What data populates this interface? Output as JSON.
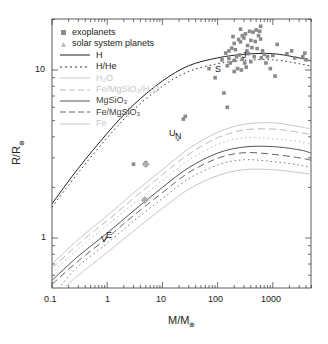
{
  "chart_data": {
    "type": "scatter",
    "title": "",
    "xlabel": "M/M⊕",
    "ylabel": "R/R⊕",
    "xscale": "log",
    "yscale": "log",
    "xlim": [
      0.1,
      5000
    ],
    "ylim": [
      0.5,
      20
    ],
    "x_ticks": [
      "0.1",
      "1",
      "10",
      "100",
      "1000"
    ],
    "y_ticks": [
      "1",
      "10"
    ],
    "grid": false,
    "legend_position": "upper left",
    "legend": [
      {
        "label": "exoplanets",
        "style": "square-marker",
        "color": "#8a8a8a"
      },
      {
        "label": "solar system planets",
        "style": "triangle-marker",
        "color": "#aaaaaa"
      },
      {
        "label": "H",
        "style": "solid",
        "color": "#222222"
      },
      {
        "label": "H/He",
        "style": "dotted",
        "color": "#333333"
      },
      {
        "label": "H₂O",
        "style": "solid",
        "color": "#c8c8c8"
      },
      {
        "label": "Fe/MgSiO₃/H₂O",
        "style": "dashed",
        "color": "#c8c8c8"
      },
      {
        "label": "MgSiO₃",
        "style": "solid",
        "color": "#555555"
      },
      {
        "label": "Fe/MgSiO₃",
        "style": "dashed",
        "color": "#666666"
      },
      {
        "label": "Fe",
        "style": "solid",
        "color": "#c8c8c8"
      }
    ],
    "series": [
      {
        "name": "H",
        "style": "solid",
        "color": "#222222",
        "width": 1,
        "points": [
          [
            0.1,
            1.6
          ],
          [
            0.3,
            2.6
          ],
          [
            1,
            4.2
          ],
          [
            3,
            6.2
          ],
          [
            10,
            8.6
          ],
          [
            30,
            10.6
          ],
          [
            100,
            11.8
          ],
          [
            300,
            12.4
          ],
          [
            1000,
            12.5
          ],
          [
            3000,
            11.8
          ],
          [
            5000,
            11.3
          ]
        ]
      },
      {
        "name": "H/He",
        "style": "dotted",
        "color": "#333333",
        "width": 1,
        "points": [
          [
            0.1,
            1.53
          ],
          [
            0.3,
            2.45
          ],
          [
            1,
            3.95
          ],
          [
            3,
            5.8
          ],
          [
            10,
            8.0
          ],
          [
            30,
            9.8
          ],
          [
            100,
            10.9
          ],
          [
            300,
            11.4
          ],
          [
            1000,
            11.5
          ],
          [
            3000,
            10.9
          ],
          [
            5000,
            10.5
          ]
        ]
      },
      {
        "name": "H₂O",
        "style": "solid",
        "color": "#c8c8c8",
        "width": 1,
        "points": [
          [
            0.1,
            0.7
          ],
          [
            0.3,
            0.98
          ],
          [
            1,
            1.36
          ],
          [
            3,
            1.85
          ],
          [
            10,
            2.55
          ],
          [
            30,
            3.4
          ],
          [
            100,
            4.25
          ],
          [
            300,
            4.75
          ],
          [
            1000,
            4.85
          ],
          [
            3000,
            4.6
          ],
          [
            5000,
            4.45
          ]
        ]
      },
      {
        "name": "Fe/MgSiO₃/H₂O",
        "style": "dashed",
        "color": "#bbbbbb",
        "width": 1,
        "points": [
          [
            0.1,
            0.66
          ],
          [
            0.3,
            0.92
          ],
          [
            1,
            1.27
          ],
          [
            3,
            1.72
          ],
          [
            10,
            2.38
          ],
          [
            30,
            3.15
          ],
          [
            100,
            3.95
          ],
          [
            300,
            4.4
          ],
          [
            1000,
            4.45
          ],
          [
            3000,
            4.25
          ],
          [
            5000,
            4.1
          ]
        ]
      },
      {
        "name": "H₂O-dotted",
        "style": "dotted",
        "color": "#bbbbbb",
        "width": 1,
        "points": [
          [
            0.1,
            0.62
          ],
          [
            0.3,
            0.86
          ],
          [
            1,
            1.19
          ],
          [
            3,
            1.6
          ],
          [
            10,
            2.2
          ],
          [
            30,
            2.9
          ],
          [
            100,
            3.6
          ],
          [
            300,
            3.95
          ],
          [
            1000,
            3.9
          ],
          [
            3000,
            3.75
          ],
          [
            5000,
            3.6
          ]
        ]
      },
      {
        "name": "MgSiO₃",
        "style": "solid",
        "color": "#555555",
        "width": 1,
        "points": [
          [
            0.1,
            0.56
          ],
          [
            0.3,
            0.78
          ],
          [
            1,
            1.07
          ],
          [
            3,
            1.45
          ],
          [
            10,
            2.0
          ],
          [
            30,
            2.62
          ],
          [
            100,
            3.2
          ],
          [
            300,
            3.48
          ],
          [
            1000,
            3.5
          ],
          [
            3000,
            3.35
          ],
          [
            5000,
            3.2
          ]
        ]
      },
      {
        "name": "Fe/MgSiO₃",
        "style": "dashed",
        "color": "#666666",
        "width": 1,
        "points": [
          [
            0.1,
            0.53
          ],
          [
            0.3,
            0.73
          ],
          [
            1,
            1.0
          ],
          [
            3,
            1.36
          ],
          [
            10,
            1.86
          ],
          [
            30,
            2.45
          ],
          [
            100,
            2.98
          ],
          [
            300,
            3.22
          ],
          [
            1000,
            3.15
          ],
          [
            3000,
            3.0
          ],
          [
            5000,
            2.9
          ]
        ]
      },
      {
        "name": "Fe/MgSiO₃-dotted",
        "style": "dotted",
        "color": "#777777",
        "width": 1,
        "points": [
          [
            0.13,
            0.5
          ],
          [
            0.3,
            0.68
          ],
          [
            1,
            0.93
          ],
          [
            3,
            1.26
          ],
          [
            10,
            1.72
          ],
          [
            30,
            2.25
          ],
          [
            100,
            2.72
          ],
          [
            300,
            2.92
          ],
          [
            1000,
            2.85
          ],
          [
            3000,
            2.72
          ],
          [
            5000,
            2.62
          ]
        ]
      },
      {
        "name": "Fe",
        "style": "solid",
        "color": "#c8c8c8",
        "width": 1,
        "points": [
          [
            0.16,
            0.5
          ],
          [
            0.3,
            0.6
          ],
          [
            1,
            0.82
          ],
          [
            3,
            1.1
          ],
          [
            10,
            1.5
          ],
          [
            30,
            1.95
          ],
          [
            100,
            2.35
          ],
          [
            300,
            2.55
          ],
          [
            1000,
            2.55
          ],
          [
            3000,
            2.45
          ],
          [
            5000,
            2.4
          ]
        ]
      }
    ],
    "exoplanets": [
      [
        3,
        2.75
      ],
      [
        5,
        2.8
      ],
      [
        24,
        5.1
      ],
      [
        26,
        5.3
      ],
      [
        130,
        7.3
      ],
      [
        150,
        6.0
      ],
      [
        90,
        9.0
      ],
      [
        70,
        10.2
      ],
      [
        150,
        10.6
      ],
      [
        170,
        11.0
      ],
      [
        200,
        11.4
      ],
      [
        220,
        12.0
      ],
      [
        180,
        13.5
      ],
      [
        200,
        14.4
      ],
      [
        210,
        13.2
      ],
      [
        240,
        15.2
      ],
      [
        260,
        14.7
      ],
      [
        280,
        16.0
      ],
      [
        300,
        15.5
      ],
      [
        320,
        16.4
      ],
      [
        340,
        13.0
      ],
      [
        350,
        14.0
      ],
      [
        360,
        12.5
      ],
      [
        380,
        17.0
      ],
      [
        400,
        15.0
      ],
      [
        400,
        11.2
      ],
      [
        420,
        13.6
      ],
      [
        440,
        16.8
      ],
      [
        460,
        12.0
      ],
      [
        480,
        14.8
      ],
      [
        500,
        17.3
      ],
      [
        520,
        13.4
      ],
      [
        250,
        12.3
      ],
      [
        280,
        11.6
      ],
      [
        310,
        11.0
      ],
      [
        330,
        10.4
      ],
      [
        270,
        10.0
      ],
      [
        230,
        10.2
      ],
      [
        200,
        9.8
      ],
      [
        260,
        17.5
      ],
      [
        190,
        15.8
      ],
      [
        160,
        13.0
      ],
      [
        550,
        16.0
      ],
      [
        600,
        15.3
      ],
      [
        650,
        13.0
      ],
      [
        700,
        12.4
      ],
      [
        750,
        11.0
      ],
      [
        900,
        10.2
      ],
      [
        1100,
        9.2
      ],
      [
        1200,
        14.2
      ],
      [
        600,
        18.2
      ],
      [
        580,
        17.0
      ],
      [
        620,
        11.8
      ],
      [
        1800,
        12.5
      ],
      [
        2200,
        13.0
      ],
      [
        2500,
        11.8
      ],
      [
        3500,
        12.0
      ],
      [
        3800,
        12.6
      ],
      [
        4000,
        11.5
      ],
      [
        160,
        11.7
      ],
      [
        140,
        12.6
      ],
      [
        120,
        11.5
      ],
      [
        1000,
        12.2
      ],
      [
        800,
        12.0
      ]
    ],
    "solar_system_planets": [
      {
        "label": "V",
        "mass": 0.815,
        "radius": 0.95
      },
      {
        "label": "E",
        "mass": 1.0,
        "radius": 1.0
      },
      {
        "label": "U",
        "mass": 14.5,
        "radius": 4.0
      },
      {
        "label": "N",
        "mass": 17.1,
        "radius": 3.88
      },
      {
        "label": "S",
        "mass": 95,
        "radius": 9.45
      },
      {
        "label": "J",
        "mass": 318,
        "radius": 11.2
      }
    ],
    "special_markers": [
      {
        "style": "circle-plus",
        "mass": 5.0,
        "radius": 2.75
      },
      {
        "style": "circle-plus",
        "mass": 4.8,
        "radius": 1.68
      }
    ]
  },
  "labels": {
    "x_tick_0": "0.1",
    "x_tick_1": "1",
    "x_tick_2": "10",
    "x_tick_3": "100",
    "x_tick_4": "1000",
    "y_tick_0": "1",
    "y_tick_1": "10",
    "xlabel": "M/M",
    "ylabel": "R/R",
    "earth_symbol": "⊕",
    "planet_V": "V",
    "planet_E": "E",
    "planet_U": "U",
    "planet_N": "N",
    "planet_S": "S",
    "planet_J": "J"
  },
  "legend_labels": {
    "exoplanets": "exoplanets",
    "solar": "solar system planets",
    "H": "H",
    "HHe": "H/He",
    "H2O": "H₂O",
    "FeMgSiO3H2O": "Fe/MgSiO₃/H₂O",
    "MgSiO3": "MgSiO₃",
    "FeMgSiO3": "Fe/MgSiO₃",
    "Fe": "Fe"
  }
}
